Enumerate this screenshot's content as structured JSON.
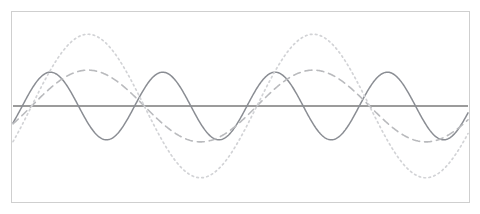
{
  "figure": {
    "background_color": "#ffffff",
    "width": 480,
    "height": 214,
    "frame": {
      "x": 11,
      "y": 11,
      "width": 459,
      "height": 192,
      "border_color": "#cfcfcf",
      "border_width": 1
    }
  },
  "chart_data": {
    "type": "line",
    "title": "",
    "subtitle": "",
    "xlabel": "",
    "ylabel": "",
    "xlim": [
      0,
      1
    ],
    "ylim": [
      -1.1,
      1.1
    ],
    "grid": false,
    "legend": "none",
    "tick_labels_x": [],
    "tick_labels_y": [],
    "annotations": [],
    "axis_line": {
      "name": "zero-axis",
      "y_value": 0,
      "color": "#7a7a7a",
      "width": 1.3,
      "style": "solid",
      "x_start": 0.0,
      "x_end": 1.0
    },
    "series": [
      {
        "name": "high-frequency-wave",
        "style": "solid",
        "color": "#8a8d93",
        "width": 1.5,
        "amplitude": 0.49,
        "cycles": 4.05,
        "phase": -0.52,
        "px_peak_y": 72,
        "px_trough_y": 139,
        "px_zero_crossings": [
          133,
          190,
          245,
          300,
          356,
          411
        ]
      },
      {
        "name": "mid-frequency-dashed-wave",
        "style": "dashed",
        "color": "#b9babd",
        "width": 1.6,
        "dash_pattern": "7,5",
        "amplitude": 0.52,
        "cycles": 2.02,
        "phase": -0.52,
        "px_peak_y": 71,
        "px_trough_y": 142,
        "px_zero_crossings": [
          190,
          300,
          411
        ]
      },
      {
        "name": "large-amplitude-dotted-wave",
        "style": "dotted",
        "color": "#d2d3d6",
        "width": 1.7,
        "dash_pattern": "1.6,3.4",
        "amplitude": 1.04,
        "cycles": 2.02,
        "phase": -0.52,
        "px_peak_y": 34,
        "px_trough_y": 177,
        "px_zero_crossings": [
          190,
          300,
          411
        ]
      }
    ]
  }
}
